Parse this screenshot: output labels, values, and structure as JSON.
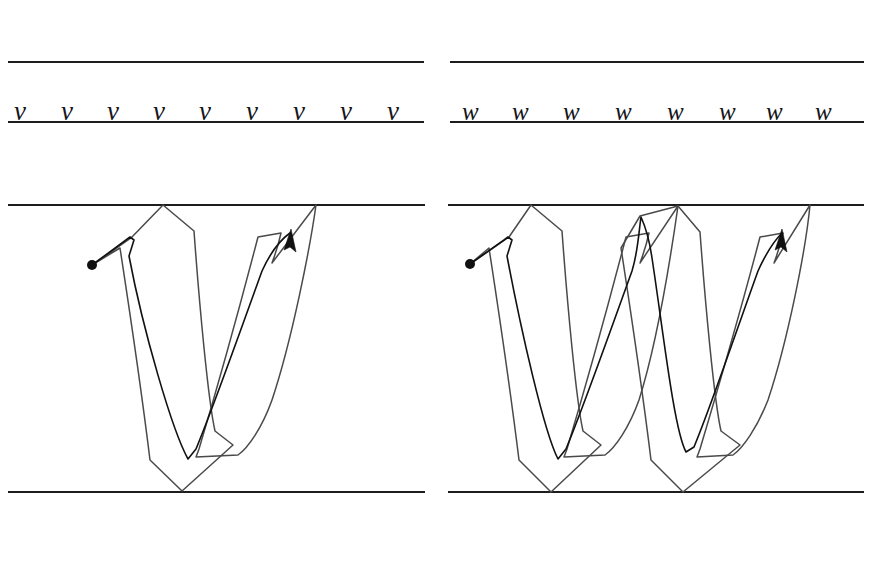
{
  "sheet": {
    "title": "Italic Calligraphy Practice Sheet — letters v and w",
    "background_color": "#ffffff",
    "rule_color": "#1d1d1d",
    "outline_color": "#4a4a4a",
    "stroke_color": "#111111",
    "width": 893,
    "height": 561
  },
  "panels": [
    {
      "id": "left",
      "letter": "v",
      "practice_row": {
        "top_rule_y": 62,
        "baseline_y": 122,
        "x_start": 8,
        "x_end": 424,
        "letters": [
          "v",
          "v",
          "v",
          "v",
          "v",
          "v",
          "v",
          "v",
          "v"
        ],
        "letter_count": 9
      },
      "demo_row": {
        "top_rule_y": 205,
        "baseline_y": 492,
        "x_start": 8,
        "x_end": 425,
        "start_dot": {
          "x": 92,
          "y": 265,
          "r": 5
        },
        "arrow_tip": {
          "x": 291,
          "y": 229
        },
        "apex_points": [
          {
            "x": 163,
            "y": 205
          },
          {
            "x": 316,
            "y": 205
          }
        ],
        "vertex_points": [
          {
            "x": 182,
            "y": 491
          }
        ]
      }
    },
    {
      "id": "right",
      "letter": "w",
      "practice_row": {
        "top_rule_y": 62,
        "baseline_y": 122,
        "x_start": 450,
        "x_end": 864,
        "letters": [
          "w",
          "w",
          "w",
          "w",
          "w",
          "w",
          "w",
          "w"
        ],
        "letter_count": 8
      },
      "demo_row": {
        "top_rule_y": 205,
        "baseline_y": 492,
        "x_start": 448,
        "x_end": 864,
        "start_dot": {
          "x": 470,
          "y": 264,
          "r": 5
        },
        "arrow_tip": {
          "x": 782,
          "y": 229
        },
        "apex_points": [
          {
            "x": 531,
            "y": 205
          },
          {
            "x": 678,
            "y": 206
          },
          {
            "x": 810,
            "y": 205
          }
        ],
        "vertex_points": [
          {
            "x": 551,
            "y": 492
          },
          {
            "x": 683,
            "y": 492
          }
        ]
      }
    }
  ],
  "geometry": {
    "v_outline_path": "M 92 265 L 131 238 L 163 205 L 193 229 L 214 430 L 232 444 L 182 491 L 148 459 L 120 247 Z",
    "v_outline_path_right": "M 198 447 L 258 236 L 280 232 L 316 205 L 302 249 L 270 389 L 238 444 L 195 455 Z",
    "v_stroke_path": "M 92 265 L 124 240 L 127 237 L 133 238 L 128 256 L 188 459 L 196 448 L 247 316 L 272 248 L 291 232",
    "w_outline_left_v": "M 470 264 L 509 237 L 531 205 L 561 229 L 583 430 L 601 444 L 551 492 L 517 459 L 489 247 Z",
    "w_outline_mid_up": "M 566 447 L 626 236 L 648 232 L 678 206 L 664 249 L 632 389 L 600 444 L 563 455 Z",
    "w_outline_mid_v": "M 678 206 L 700 230 L 722 430 L 740 444 L 683 492 L 649 459 L 621 247 L 640 216 Z",
    "w_outline_right_up": "M 699 447 L 760 236 L 782 232 L 810 205 L 797 249 L 766 389 L 733 444 L 696 455 Z",
    "w_stroke_path": "M 470 264 L 502 240 L 505 237 L 511 238 L 506 256 L 558 459 L 566 448 L 612 316 L 637 248 L 640 216 L 652 232 L 676 430 L 686 449 L 693 447 L 740 316 L 764 248 L 782 232"
  },
  "icons": {
    "start_dot": "start-dot-icon",
    "arrow_head": "arrow-head-icon"
  }
}
